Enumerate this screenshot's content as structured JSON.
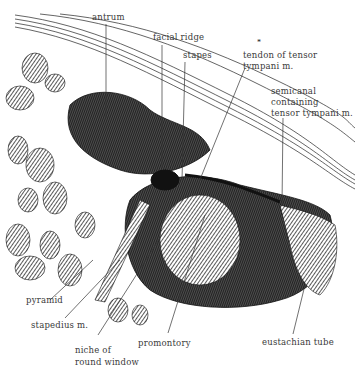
{
  "figure": {
    "colors": {
      "ink": "#1a1a1a",
      "label": "#3a3a3a",
      "background": "#ffffff"
    }
  },
  "labels": {
    "antrum": "antrum",
    "facial_ridge": "facial ridge",
    "stapes": "stapes",
    "tendon_line1": "tendon of tensor",
    "tendon_line2": "tympani m.",
    "semicanal_line1": "semicanal",
    "semicanal_line2": "containing",
    "semicanal_line3": "tensor tympani m.",
    "pyramid": "pyramid",
    "stapedius": "stapedius m.",
    "niche_line1": "niche of",
    "niche_line2": "round window",
    "promontory": "promontory",
    "eustachian_tube": "eustachian tube",
    "asterisk": "*"
  }
}
